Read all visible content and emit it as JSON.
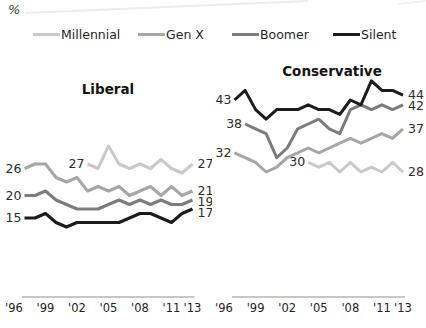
{
  "unit_label": "%",
  "legend": {
    "items": [
      {
        "label": "Millennial",
        "color": "#c9c9c9"
      },
      {
        "label": "Gen X",
        "color": "#a6a6a6"
      },
      {
        "label": "Boomer",
        "color": "#7c7c7c"
      },
      {
        "label": "Silent",
        "color": "#1c1c1c"
      }
    ]
  },
  "chart_data": {
    "type": "line",
    "unit": "%",
    "x_ticks": {
      "labels": [
        "'96",
        "'99",
        "'02",
        "'05",
        "'08",
        "'11",
        "'13"
      ],
      "years": [
        1996,
        1999,
        2002,
        2005,
        2008,
        2011,
        2013
      ]
    },
    "panels": [
      {
        "id": "liberal",
        "title": "Liberal",
        "x_range": [
          1996,
          2013
        ],
        "series": [
          {
            "name": "Millennial",
            "color": "#c9c9c9",
            "start_year": 2003,
            "start_label": 27,
            "end_label": 27,
            "values": [
              27,
              26,
              31,
              27,
              26,
              27,
              26,
              28,
              26,
              25,
              27
            ]
          },
          {
            "name": "Gen X",
            "color": "#a6a6a6",
            "start_year": 1997,
            "start_label": 26,
            "end_label": 21,
            "values": [
              26,
              27,
              27,
              24,
              23,
              24,
              21,
              22,
              21,
              22,
              20,
              21,
              22,
              20,
              22,
              20,
              21
            ]
          },
          {
            "name": "Boomer",
            "color": "#7c7c7c",
            "start_year": 1997,
            "start_label": 20,
            "end_label": 19,
            "values": [
              20,
              20,
              21,
              19,
              18,
              17,
              17,
              17,
              18,
              19,
              18,
              19,
              18,
              19,
              18,
              18,
              19
            ]
          },
          {
            "name": "Silent",
            "color": "#1c1c1c",
            "start_year": 1997,
            "start_label": 15,
            "end_label": 17,
            "values": [
              15,
              15,
              16,
              14,
              13,
              14,
              14,
              14,
              14,
              14,
              15,
              16,
              16,
              15,
              14,
              16,
              17
            ]
          }
        ]
      },
      {
        "id": "conservative",
        "title": "Conservative",
        "x_range": [
          1996,
          2013
        ],
        "series": [
          {
            "name": "Millennial",
            "color": "#c9c9c9",
            "start_year": 2004,
            "start_label": 30,
            "end_label": 28,
            "values": [
              30,
              29,
              30,
              28,
              30,
              28,
              29,
              28,
              30,
              28
            ]
          },
          {
            "name": "Gen X",
            "color": "#a6a6a6",
            "start_year": 1997,
            "start_label": 32,
            "end_label": 37,
            "values": [
              32,
              31,
              30,
              28,
              29,
              31,
              32,
              33,
              32,
              33,
              34,
              35,
              34,
              35,
              36,
              35,
              37
            ]
          },
          {
            "name": "Boomer",
            "color": "#7c7c7c",
            "start_year": 1998,
            "start_label": 38,
            "end_label": 42,
            "values": [
              38,
              37,
              36,
              31,
              33,
              37,
              38,
              39,
              37,
              36,
              41,
              42,
              41,
              42,
              41,
              42
            ]
          },
          {
            "name": "Silent",
            "color": "#1c1c1c",
            "start_year": 1997,
            "start_label": 43,
            "end_label": 44,
            "values": [
              43,
              45,
              41,
              39,
              41,
              41,
              41,
              42,
              41,
              41,
              40,
              43,
              42,
              47,
              45,
              45,
              44
            ]
          }
        ]
      }
    ]
  }
}
